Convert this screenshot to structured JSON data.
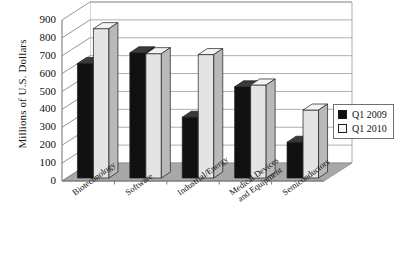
{
  "chart_data": {
    "type": "bar",
    "title": "",
    "xlabel": "",
    "ylabel": "Millions of U.S. Dollars",
    "ylim": [
      0,
      900
    ],
    "ytick_step": 100,
    "yticks": [
      900,
      800,
      700,
      600,
      500,
      400,
      300,
      200,
      100,
      0
    ],
    "grid": true,
    "grid_axis": "y",
    "style": "3d-column",
    "legend_position": "right",
    "categories": [
      "Biotechnology",
      "Software",
      "Industrial/Energy",
      "Medical Devices and Equipment",
      "Semiconductors"
    ],
    "category_lines": [
      [
        "Biotechnology"
      ],
      [
        "Software"
      ],
      [
        "Industrial/Energy"
      ],
      [
        "Medical Devices",
        "and Equipment"
      ],
      [
        "Semiconductors"
      ]
    ],
    "series": [
      {
        "name": "Q1 2009",
        "color": "#111111",
        "values": [
          640,
          700,
          340,
          510,
          200
        ]
      },
      {
        "name": "Q1 2010",
        "color": "#e2e2e2",
        "values": [
          835,
          695,
          690,
          520,
          380
        ]
      }
    ]
  },
  "legend": {
    "entries": [
      {
        "label": "Q1 2009",
        "swatch": "#111111"
      },
      {
        "label": "Q1 2010",
        "swatch": "#f2f2f2"
      }
    ]
  },
  "axes": {
    "y_title": "Millions of U.S. Dollars"
  },
  "colors": {
    "series_2009_front": "#111111",
    "series_2009_top": "#3a3a3a",
    "series_2009_side": "#2a2a2a",
    "series_2010_front": "#e4e4e4",
    "series_2010_top": "#f4f4f4",
    "series_2010_side": "#b9b9b9",
    "floor": "#a8a8a8",
    "wall": "#ffffff",
    "gridline": "#9a9a9a",
    "axis": "#7a7a7a",
    "text": "#111111"
  }
}
